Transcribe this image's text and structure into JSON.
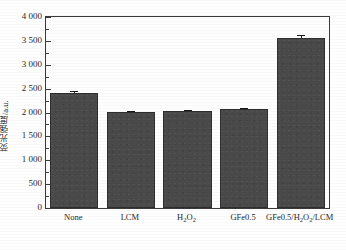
{
  "chart_data": {
    "type": "bar",
    "title": "",
    "subtitle": "",
    "xlabel": "",
    "ylabel": "荧光强度/a.u.",
    "categories": [
      "None",
      "LCM",
      "H2O2",
      "GFe0.5",
      "GFe0.5/H2O2/LCM"
    ],
    "category_labels_html": [
      "None",
      "LCM",
      "H<sub>2</sub>O<sub>2</sub>",
      "GFe0.5",
      "GFe0.5/H<sub>2</sub>O<sub>2</sub>/LCM"
    ],
    "values": [
      2410,
      2010,
      2030,
      2070,
      3560
    ],
    "errors": [
      40,
      20,
      25,
      25,
      60
    ],
    "ylim": [
      0,
      4000
    ],
    "ytick_step": 500,
    "yminor_step": 250,
    "ytick_labels": [
      "4 000",
      "3 500",
      "3 000",
      "2 500",
      "2 000",
      "1 500",
      "1 000",
      "500",
      "0"
    ],
    "ytick_values": [
      4000,
      3500,
      3000,
      2500,
      2000,
      1500,
      1000,
      500,
      0
    ],
    "grid": false,
    "legend": null,
    "legend_position": "none",
    "bar_color": "#4a4a4a",
    "bar_edge_color": "#2e2e2e",
    "axis_color": "#3a3a3a",
    "frame": "box",
    "tick_direction": "in"
  }
}
